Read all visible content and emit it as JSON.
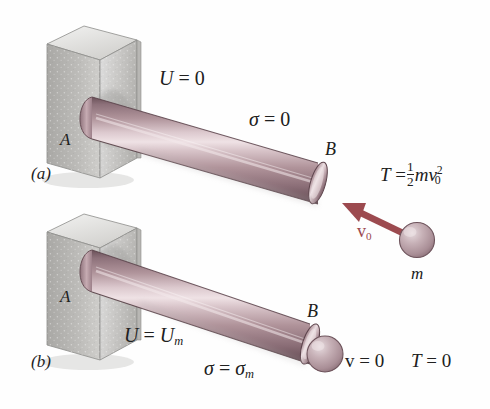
{
  "figure": {
    "background_color": "#fefefe",
    "rod_color": "#a98b93",
    "rod_highlight_color": "#e3d2d6",
    "rod_dark_color": "#6e545c",
    "wall_color": "#c9c9c7",
    "wall_shadow_color": "#9a9a98",
    "wall_light_color": "#e4e4e2",
    "arrow_color": "#9c4a4f",
    "sphere_color": "#b49aa0",
    "text_color": "#202020"
  },
  "panels": [
    {
      "id": "a",
      "tag": "(a)",
      "support_label": "A",
      "free_end_label": "B",
      "labels": [
        {
          "name": "strain-energy",
          "lhs": "U",
          "rel": "=",
          "rhs": "0"
        },
        {
          "name": "stress",
          "lhs": "σ",
          "rel": "=",
          "rhs": "0"
        }
      ]
    },
    {
      "id": "b",
      "tag": "(b)",
      "support_label": "A",
      "free_end_label": "B",
      "labels": [
        {
          "name": "strain-energy",
          "lhs": "U",
          "rel": "=",
          "rhs": "U",
          "rhs_sub": "m"
        },
        {
          "name": "stress",
          "lhs": "σ",
          "rel": "=",
          "rhs": "σ",
          "rhs_sub": "m"
        },
        {
          "name": "velocity",
          "lhs": "v",
          "rel": "=",
          "rhs": "0"
        },
        {
          "name": "kinetic-energy",
          "lhs": "T",
          "rel": "=",
          "rhs": "0"
        }
      ]
    }
  ],
  "projectile": {
    "mass_label": "m",
    "velocity_label": "v",
    "velocity_sub": "0",
    "kinetic_energy": {
      "lhs": "T",
      "rel": "=",
      "frac_num": "1",
      "frac_den": "2",
      "body": "mv",
      "sub": "0",
      "sup": "2"
    }
  }
}
